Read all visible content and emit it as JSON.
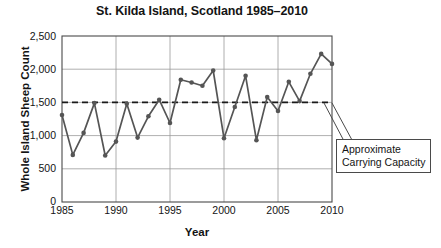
{
  "chart_data": {
    "type": "line",
    "title": "St. Kilda Island, Scotland 1985–2010",
    "xlabel": "Year",
    "ylabel": "Whole Island Sheep Count",
    "xlim": [
      1985,
      2010
    ],
    "ylim": [
      0,
      2500
    ],
    "grid": true,
    "legend": null,
    "x": [
      1985,
      1986,
      1987,
      1988,
      1989,
      1990,
      1991,
      1992,
      1993,
      1994,
      1995,
      1996,
      1997,
      1998,
      1999,
      2000,
      2001,
      2002,
      2003,
      2004,
      2005,
      2006,
      2007,
      2008,
      2009,
      2010
    ],
    "values": [
      1310,
      710,
      1040,
      1490,
      700,
      910,
      1480,
      970,
      1290,
      1540,
      1190,
      1840,
      1800,
      1750,
      1980,
      960,
      1430,
      1900,
      930,
      1580,
      1370,
      1810,
      1520,
      1930,
      2230,
      2080
    ],
    "series": [
      {
        "name": "Whole Island Sheep Count",
        "values": [
          1310,
          710,
          1040,
          1490,
          700,
          910,
          1480,
          970,
          1290,
          1540,
          1190,
          1840,
          1800,
          1750,
          1980,
          960,
          1430,
          1900,
          930,
          1580,
          1370,
          1810,
          1520,
          1930,
          2230,
          2080
        ],
        "color": "#555555",
        "marker": "circle"
      }
    ],
    "reference_line": {
      "label": "Approximate Carrying Capacity",
      "value": 1500,
      "style": "dashed",
      "color": "#1a1a1a"
    },
    "yticks": [
      0,
      500,
      1000,
      1500,
      2000,
      2500
    ],
    "ytick_labels": [
      "0",
      "500",
      "1,000",
      "1,500",
      "2,000",
      "2,500"
    ],
    "xticks": [
      1985,
      1990,
      1995,
      2000,
      2005,
      2010
    ],
    "xtick_labels": [
      "1985",
      "1990",
      "1995",
      "2000",
      "2005",
      "2010"
    ],
    "annotation_lines": [
      "Approximate",
      "Carrying Capacity"
    ]
  },
  "colors": {
    "line": "#555555",
    "grid": "#9a9a9a",
    "axis": "#4a4a4a",
    "text": "#141414",
    "background": "#ffffff"
  }
}
